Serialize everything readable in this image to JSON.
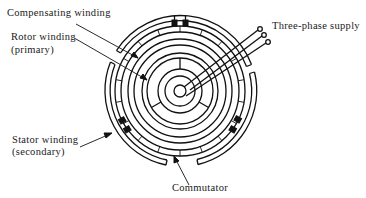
{
  "diagram": {
    "labels": {
      "compensating_winding": "Compensating winding",
      "rotor_winding_line1": "Rotor winding",
      "rotor_winding_line2": "(primary)",
      "stator_winding_line1": "Stator winding",
      "stator_winding_line2": "(secondary)",
      "commutator": "Commutator",
      "three_phase_supply": "Three-phase supply"
    },
    "colors": {
      "ink": "#111111",
      "background": "#ffffff"
    }
  }
}
